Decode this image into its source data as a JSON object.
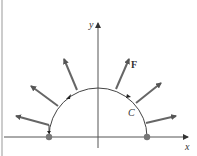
{
  "diagram": {
    "labels": {
      "y_axis": "y",
      "x_axis": "x",
      "vector_field": "F",
      "curve": "C"
    },
    "curve": {
      "type": "semicircle",
      "center": [
        98,
        137
      ],
      "radius": 49,
      "orientation": "clockwise (left to right)"
    },
    "endpoints": [
      [
        49,
        137
      ],
      [
        148,
        137
      ]
    ],
    "vectors": [
      {
        "from": [
          49,
          125
        ],
        "to": [
          15,
          116
        ]
      },
      {
        "from": [
          58,
          106
        ],
        "to": [
          30,
          85
        ]
      },
      {
        "from": [
          77,
          90
        ],
        "to": [
          63,
          58
        ]
      },
      {
        "from": [
          116,
          89
        ],
        "to": [
          130,
          58
        ]
      },
      {
        "from": [
          136,
          103
        ],
        "to": [
          162,
          82
        ]
      },
      {
        "from": [
          146,
          123
        ],
        "to": [
          177,
          116
        ]
      }
    ],
    "colors": {
      "axis": "#555555",
      "curve": "#444444",
      "vector": "#666666",
      "dot": "#777777"
    }
  }
}
